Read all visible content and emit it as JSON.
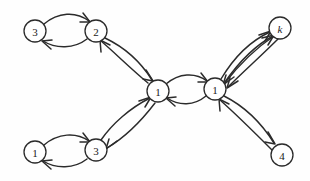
{
  "figure": {
    "type": "directed-graph",
    "background_color": "#fefefe",
    "stroke_color": "#2b2b2b",
    "node_fill": "#ffffff",
    "width": 310,
    "height": 181
  },
  "nodes": [
    {
      "id": "n3a",
      "label": "3",
      "x": 35,
      "y": 31,
      "r": 11,
      "italic": false
    },
    {
      "id": "n2",
      "label": "2",
      "x": 96,
      "y": 31,
      "r": 11,
      "italic": false
    },
    {
      "id": "nk",
      "label": "k",
      "x": 280,
      "y": 28,
      "r": 11,
      "italic": true
    },
    {
      "id": "n1c",
      "label": "1",
      "x": 158,
      "y": 91,
      "r": 11,
      "italic": false
    },
    {
      "id": "n1r",
      "label": "1",
      "x": 215,
      "y": 89,
      "r": 11,
      "italic": false
    },
    {
      "id": "n1b",
      "label": "1",
      "x": 35,
      "y": 152,
      "r": 11,
      "italic": false
    },
    {
      "id": "n3b",
      "label": "3",
      "x": 96,
      "y": 150,
      "r": 11,
      "italic": false
    },
    {
      "id": "n4",
      "label": "4",
      "x": 282,
      "y": 155,
      "r": 11,
      "italic": false
    }
  ],
  "edges": [
    {
      "from": "n3a",
      "to": "n2",
      "direction": "bidirectional",
      "pair": "lens"
    },
    {
      "from": "n2",
      "to": "n1c",
      "direction": "bidirectional",
      "pair": "lens"
    },
    {
      "from": "n1b",
      "to": "n3b",
      "direction": "bidirectional",
      "pair": "lens"
    },
    {
      "from": "n3b",
      "to": "n1c",
      "direction": "bidirectional",
      "pair": "lens"
    },
    {
      "from": "n1c",
      "to": "n1r",
      "direction": "bidirectional",
      "pair": "lens"
    },
    {
      "from": "n1r",
      "to": "nk",
      "direction": "bidirectional",
      "pair": "lens"
    },
    {
      "from": "n1r",
      "to": "n4",
      "direction": "bidirectional",
      "pair": "lens"
    }
  ],
  "geometry": {
    "edge_paths": [
      {
        "name": "3a-to-2-upper",
        "d": "M 44,24 C 58,12 76,11 89,21",
        "head": "M 83,13 L 90,22 L 80,22"
      },
      {
        "name": "2-to-3a-lower",
        "d": "M 87,39 C 74,49 56,49 43,41",
        "head": "M 51,49 L 42,41 L 52,40"
      },
      {
        "name": "2-to-1c-right",
        "d": "M 105,38 C 126,48 142,64 152,80",
        "head": "M 146,70 L 153,81 L 143,79"
      },
      {
        "name": "1c-to-2-left",
        "d": "M 148,83 C 130,68 114,52 101,41",
        "head": "M 101,52 L 100,40 L 110,45"
      },
      {
        "name": "1b-to-3b-upper",
        "d": "M 44,145 C 58,133 76,132 89,141",
        "head": "M 83,133 L 90,142 L 80,142"
      },
      {
        "name": "3b-to-1b-lower",
        "d": "M 87,159 C 74,169 56,169 43,161",
        "head": "M 51,169 L 42,161 L 52,160"
      },
      {
        "name": "3b-to-1c-up",
        "d": "M 101,140 C 112,124 130,108 150,98",
        "head": "M 139,101 L 151,97 L 145,107"
      },
      {
        "name": "1c-to-3b-down",
        "d": "M 155,103 C 142,120 124,138 107,148",
        "head": "M 117,141 L 106,149 L 109,139"
      },
      {
        "name": "1c-to-1r-upper",
        "d": "M 166,84 C 179,73 195,72 207,81",
        "head": "M 201,73 L 208,82 L 198,82"
      },
      {
        "name": "1r-to-1c-lower",
        "d": "M 206,96 C 194,106 179,106 167,98",
        "head": "M 175,106 L 166,98 L 176,97"
      },
      {
        "name": "1r-to-k-outer",
        "d": "M 221,79 C 233,59 250,41 270,32",
        "head": "M 259,35 L 271,31 L 265,41"
      },
      {
        "name": "k-to-1r-inner",
        "d": "M 274,36 C 256,48 238,66 224,84",
        "head": "M 234,77 L 223,85 L 226,75"
      },
      {
        "name": "1r-to-k-alt",
        "d": "M 225,82 C 239,62 256,45 273,36",
        "head": "M 262,38 L 274,35 L 268,45"
      },
      {
        "name": "k-to-1r-alt",
        "d": "M 278,39 C 262,55 243,72 228,87",
        "head": "M 238,81 L 227,88 L 230,78"
      },
      {
        "name": "1r-to-4-right",
        "d": "M 224,96 C 244,106 262,124 274,143",
        "head": "M 268,132 L 275,144 L 265,142"
      },
      {
        "name": "4-to-1r-left",
        "d": "M 272,150 C 256,134 238,116 220,100",
        "head": "M 220,111 L 219,99 L 229,104"
      }
    ]
  }
}
